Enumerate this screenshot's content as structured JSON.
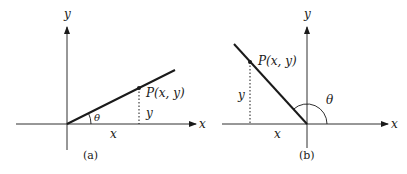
{
  "panels": [
    {
      "id": "a",
      "caption": "(a)",
      "axis_x_label": "x",
      "axis_y_label": "y",
      "point_label": "P(x, y)",
      "leg_x_label": "x",
      "leg_y_label": "y",
      "angle_label": "θ"
    },
    {
      "id": "b",
      "caption": "(b)",
      "axis_x_label": "x",
      "axis_y_label": "y",
      "point_label": "P(x, y)",
      "leg_x_label": "x",
      "leg_y_label": "y",
      "angle_label": "θ"
    }
  ],
  "colors": {
    "ink": "#1a1a1a",
    "background": "#ffffff"
  }
}
